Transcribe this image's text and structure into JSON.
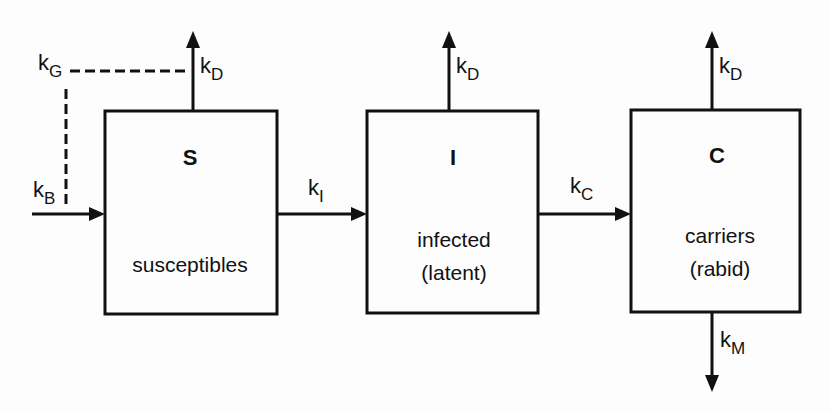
{
  "diagram": {
    "type": "compartment-model",
    "compartments": [
      {
        "id": "S",
        "symbol": "S",
        "name": "susceptibles",
        "sub": ""
      },
      {
        "id": "I",
        "symbol": "I",
        "name": "infected",
        "sub": "(latent)"
      },
      {
        "id": "C",
        "symbol": "C",
        "name": "carriers",
        "sub": "(rabid)"
      }
    ],
    "rates": {
      "kG": {
        "base": "k",
        "sub": "G"
      },
      "kB": {
        "base": "k",
        "sub": "B"
      },
      "kD_S": {
        "base": "k",
        "sub": "D"
      },
      "kD_I": {
        "base": "k",
        "sub": "D"
      },
      "kD_C": {
        "base": "k",
        "sub": "D"
      },
      "kI": {
        "base": "k",
        "sub": "I"
      },
      "kC": {
        "base": "k",
        "sub": "C"
      },
      "kM": {
        "base": "k",
        "sub": "M"
      }
    },
    "edges": [
      {
        "from": "outside",
        "to": "S",
        "rate": "kB"
      },
      {
        "from": "S",
        "to": "I",
        "rate": "kI"
      },
      {
        "from": "I",
        "to": "C",
        "rate": "kC"
      },
      {
        "from": "S",
        "to": "out-top",
        "rate": "kD"
      },
      {
        "from": "I",
        "to": "out-top",
        "rate": "kD"
      },
      {
        "from": "C",
        "to": "out-top",
        "rate": "kD"
      },
      {
        "from": "C",
        "to": "out-bottom",
        "rate": "kM"
      },
      {
        "from": "kG",
        "to": "kD/kB",
        "style": "dashed"
      }
    ]
  }
}
